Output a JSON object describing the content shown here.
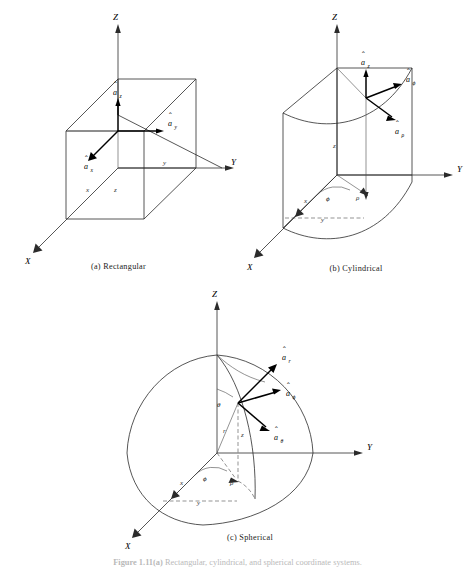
{
  "figure": {
    "caption_label": "Figure 1.11(a)",
    "caption_text": "Rectangular, cylindrical, and spherical coordinate systems."
  },
  "panels": [
    {
      "id": "rectangular",
      "caption": "(a)  Rectangular",
      "axes": {
        "X": "X",
        "Y": "Y",
        "Z": "Z"
      },
      "coords": {
        "x": "x",
        "y": "y",
        "z": "z"
      },
      "unit_vectors": [
        {
          "name": "a-hat-z",
          "hat": "ˆ",
          "base": "a",
          "sub": "z",
          "direction": "up"
        },
        {
          "name": "a-hat-y",
          "hat": "ˆ",
          "base": "a",
          "sub": "y",
          "direction": "right"
        },
        {
          "name": "a-hat-x",
          "hat": "ˆ",
          "base": "a",
          "sub": "x",
          "direction": "down-left"
        }
      ]
    },
    {
      "id": "cylindrical",
      "caption": "(b)  Cylindrical",
      "axes": {
        "X": "X",
        "Y": "Y",
        "Z": "Z"
      },
      "coords": {
        "x": "x",
        "y": "y",
        "z": "z",
        "rho": "ρ"
      },
      "angles": {
        "phi": "ϕ"
      },
      "unit_vectors": [
        {
          "name": "a-hat-z",
          "hat": "ˆ",
          "base": "a",
          "sub": "z",
          "direction": "up"
        },
        {
          "name": "a-hat-phi",
          "hat": "ˆ",
          "base": "a",
          "sub": "ϕ",
          "direction": "up-right"
        },
        {
          "name": "a-hat-rho",
          "hat": "ˆ",
          "base": "a",
          "sub": "ρ",
          "direction": "down-right"
        }
      ]
    },
    {
      "id": "spherical",
      "caption": "(c)  Spherical",
      "axes": {
        "X": "X",
        "Y": "Y",
        "Z": "Z"
      },
      "coords": {
        "x": "x",
        "y": "y",
        "z": "z",
        "r": "r",
        "rho": "ρ"
      },
      "angles": {
        "theta": "θ",
        "phi": "ϕ"
      },
      "unit_vectors": [
        {
          "name": "a-hat-r",
          "hat": "ˆ",
          "base": "a",
          "sub": "r",
          "direction": "up-right"
        },
        {
          "name": "a-hat-phi",
          "hat": "ˆ",
          "base": "a",
          "sub": "ϕ",
          "direction": "right"
        },
        {
          "name": "a-hat-theta",
          "hat": "ˆ",
          "base": "a",
          "sub": "θ",
          "direction": "down-right"
        }
      ]
    }
  ]
}
